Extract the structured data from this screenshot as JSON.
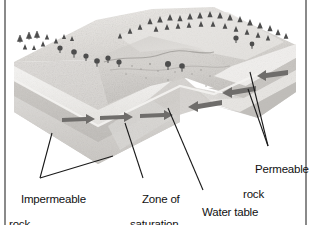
{
  "figure": {
    "kind": "block-diagram",
    "background_color": "#ffffff",
    "frame": {
      "left_rule_color": "#8a8a8a",
      "right_rule_color": "#8a8a8a"
    },
    "palette": {
      "ground_surface_light": "#e3e1de",
      "ground_surface_mid": "#cdcac6",
      "ground_surface_shadow": "#b4b1ad",
      "hill_highlight": "#eeecea",
      "permeable_band": "#f2f0ee",
      "saturated_zone": "#c9c6c2",
      "impermeable_rock": "#d8d6d3",
      "block_side_face": "#dcdad7",
      "arrow_gray": "#6e6c6a",
      "tree_dark": "#4a4a4a",
      "leader_line": "#1a1a1a",
      "text": "#111111"
    },
    "elements": {
      "flow_arrows_saturated_zone": 3,
      "flow_arrows_permeable_right": 3,
      "trees_count": 46
    }
  },
  "labels": {
    "impermeable_rock": {
      "line1": "Impermeable",
      "line2": "rock"
    },
    "zone_of_saturation": {
      "line1": "Zone of",
      "line2": "saturation"
    },
    "water_table": {
      "line1": "Water table",
      "line2": ""
    },
    "permeable_rock": {
      "line1": "Permeable",
      "line2": "rock"
    }
  }
}
